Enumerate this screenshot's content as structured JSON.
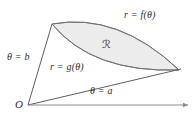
{
  "figure": {
    "kind": "polar-region-diagram",
    "title": "",
    "colors": {
      "stroke": "#6b6b6b",
      "axis": "#8a8a8a",
      "region_fill": "#ececec",
      "region_stroke": "#7a7a7a",
      "text": "#2b2b2b",
      "background": "#ffffff"
    },
    "labels": {
      "outer_curve": "r = f(θ)",
      "inner_curve": "r = g(θ)",
      "ray_upper": "θ = b",
      "ray_lower": "θ = a",
      "origin": "O",
      "region": "ℛ"
    },
    "geometry": {
      "origin": [
        28,
        105
      ],
      "ray_lower_end": [
        181,
        69
      ],
      "ray_upper_end": [
        52,
        24
      ],
      "axis_start": [
        28,
        105
      ],
      "axis_end": [
        190,
        105
      ],
      "outer_curve": {
        "from": [
          52,
          24
        ],
        "to": [
          179,
          70
        ],
        "control": [
          118,
          12
        ]
      },
      "inner_curve": {
        "from": [
          52,
          24
        ],
        "to": [
          179,
          70
        ],
        "control": [
          92,
          73
        ]
      }
    }
  }
}
